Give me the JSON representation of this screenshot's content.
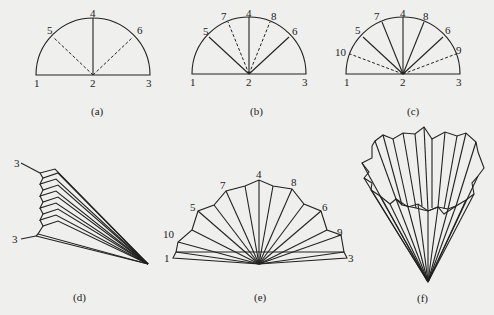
{
  "figure": {
    "panels": [
      {
        "id": "a",
        "caption": "(a)",
        "labels": [
          "1",
          "2",
          "3",
          "4",
          "5",
          "6"
        ]
      },
      {
        "id": "b",
        "caption": "(b)",
        "labels": [
          "1",
          "2",
          "3",
          "4",
          "5",
          "6",
          "7",
          "8"
        ]
      },
      {
        "id": "c",
        "caption": "(c)",
        "labels": [
          "1",
          "2",
          "3",
          "4",
          "5",
          "6",
          "7",
          "8",
          "9",
          "10"
        ]
      },
      {
        "id": "d",
        "caption": "(d)",
        "labels": [
          "3",
          "3"
        ]
      },
      {
        "id": "e",
        "caption": "(e)",
        "labels": [
          "1",
          "3",
          "4",
          "5",
          "6",
          "7",
          "8",
          "9",
          "10"
        ]
      },
      {
        "id": "f",
        "caption": "(f)",
        "labels": []
      }
    ],
    "colors": {
      "ink": "#222222",
      "paper": "#efefed"
    }
  }
}
